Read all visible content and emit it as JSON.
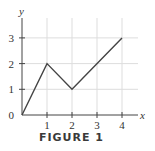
{
  "caption": "FIGURE 1",
  "colors": {
    "line": "#444444",
    "axis": "#444444",
    "grid": "#dddddd",
    "text": "#333333"
  },
  "chart_data": {
    "type": "line",
    "title": "",
    "xlabel": "x",
    "ylabel": "y",
    "x": [
      0,
      1,
      2,
      4
    ],
    "series": [
      {
        "name": "piecewise-linear",
        "values": [
          0,
          2,
          1,
          3
        ]
      }
    ],
    "xticks": [
      "1",
      "2",
      "3",
      "4"
    ],
    "yticks": [
      "0",
      "1",
      "2",
      "3"
    ],
    "xlim": [
      0,
      4.6
    ],
    "ylim": [
      0,
      3.7
    ],
    "grid": true,
    "legend": null,
    "caption": "FIGURE 1"
  },
  "axes": {
    "x_label": "x",
    "y_label": "y",
    "x_ticks": [
      "1",
      "2",
      "3",
      "4"
    ],
    "y_ticks": [
      "0",
      "1",
      "2",
      "3"
    ]
  }
}
